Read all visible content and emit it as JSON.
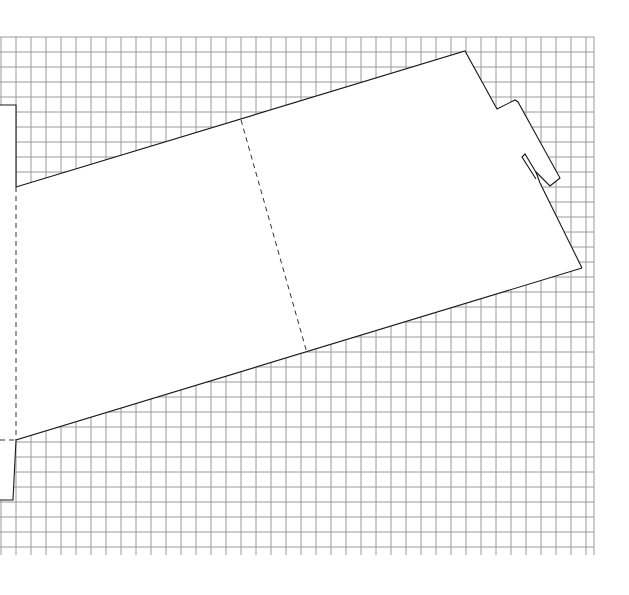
{
  "diagram": {
    "type": "dieline-template",
    "background": "grid",
    "colors": {
      "background": "#ffffff",
      "grid": "#9a9a9a",
      "cut_line": "#1a1a1a",
      "fold_line": "#333333"
    },
    "elements": [
      {
        "name": "cut-outline",
        "style": "solid"
      },
      {
        "name": "fold-line-left",
        "style": "dashed"
      },
      {
        "name": "fold-line-middle",
        "style": "dashed"
      },
      {
        "name": "fold-line-bottom-left",
        "style": "dashed"
      },
      {
        "name": "locking-tab",
        "style": "solid"
      },
      {
        "name": "tab-slot",
        "style": "solid"
      }
    ]
  }
}
